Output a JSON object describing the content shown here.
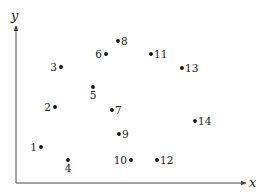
{
  "diagram": {
    "type": "scatter-points",
    "axes": {
      "x_label": "x",
      "y_label": "y",
      "origin": [
        16,
        183
      ],
      "x_end": 246,
      "y_end": 26,
      "color": "#444444"
    },
    "point_color": "#111111",
    "points": [
      {
        "label": "1",
        "px": 41,
        "py": 147,
        "label_pos": "left"
      },
      {
        "label": "2",
        "px": 55,
        "py": 107,
        "label_pos": "left"
      },
      {
        "label": "3",
        "px": 61,
        "py": 67,
        "label_pos": "left"
      },
      {
        "label": "4",
        "px": 68,
        "py": 160,
        "label_pos": "below"
      },
      {
        "label": "5",
        "px": 93,
        "py": 87,
        "label_pos": "below"
      },
      {
        "label": "6",
        "px": 106,
        "py": 54,
        "label_pos": "left"
      },
      {
        "label": "7",
        "px": 112,
        "py": 110,
        "label_pos": "right"
      },
      {
        "label": "8",
        "px": 118,
        "py": 41,
        "label_pos": "right"
      },
      {
        "label": "9",
        "px": 119,
        "py": 134,
        "label_pos": "right"
      },
      {
        "label": "10",
        "px": 131,
        "py": 160,
        "label_pos": "left"
      },
      {
        "label": "11",
        "px": 151,
        "py": 54,
        "label_pos": "right"
      },
      {
        "label": "12",
        "px": 157,
        "py": 160,
        "label_pos": "right"
      },
      {
        "label": "13",
        "px": 182,
        "py": 68,
        "label_pos": "right"
      },
      {
        "label": "14",
        "px": 195,
        "py": 121,
        "label_pos": "right"
      }
    ]
  }
}
